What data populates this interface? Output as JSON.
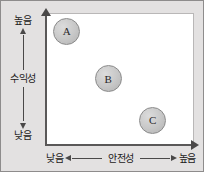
{
  "chart_data": {
    "type": "scatter",
    "title": "",
    "xlabel": "안전성",
    "ylabel": "수익성",
    "x_axis": {
      "title": "안전성",
      "low_label": "낮음",
      "high_label": "높음",
      "direction_low_icon": "arrow-left-icon",
      "direction_high_icon": "arrow-right-icon",
      "axis_arrow_icon": "arrow-right-icon"
    },
    "y_axis": {
      "title": "수익성",
      "low_label": "낮음",
      "high_label": "높음",
      "direction_low_icon": "arrow-down-icon",
      "direction_high_icon": "arrow-up-icon",
      "axis_arrow_icon": "arrow-up-icon"
    },
    "grid": false,
    "legend": "none",
    "points": [
      {
        "label": "A",
        "x": 0.14,
        "y": 0.86,
        "x_qualitative": "낮음",
        "y_qualitative": "높음"
      },
      {
        "label": "B",
        "x": 0.42,
        "y": 0.5,
        "x_qualitative": "중간",
        "y_qualitative": "중간"
      },
      {
        "label": "C",
        "x": 0.72,
        "y": 0.18,
        "x_qualitative": "높음",
        "y_qualitative": "낮음"
      }
    ],
    "colors": {
      "background": "#e3e1e1",
      "panel": "#ffffff",
      "axis": "#5a5858",
      "bubble_fill": "#c8c8c8",
      "bubble_stroke": "#8a8a8a",
      "text": "#1c1a1a"
    }
  }
}
